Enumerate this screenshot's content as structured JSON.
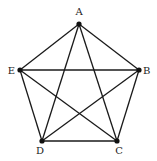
{
  "diagram": {
    "type": "complete-graph",
    "nodes": [
      {
        "id": "A",
        "label": "A",
        "x": 79,
        "y": 24,
        "lx": 79,
        "ly": 15,
        "anchor": "middle"
      },
      {
        "id": "B",
        "label": "B",
        "x": 139,
        "y": 70,
        "lx": 143,
        "ly": 74,
        "anchor": "start"
      },
      {
        "id": "C",
        "label": "C",
        "x": 117,
        "y": 141,
        "lx": 119,
        "ly": 154,
        "anchor": "middle"
      },
      {
        "id": "D",
        "label": "D",
        "x": 42,
        "y": 141,
        "lx": 40,
        "ly": 154,
        "anchor": "middle"
      },
      {
        "id": "E",
        "label": "E",
        "x": 20,
        "y": 70,
        "lx": 15,
        "ly": 74,
        "anchor": "end"
      }
    ],
    "edges": [
      [
        "A",
        "B"
      ],
      [
        "A",
        "C"
      ],
      [
        "A",
        "D"
      ],
      [
        "A",
        "E"
      ],
      [
        "B",
        "C"
      ],
      [
        "B",
        "D"
      ],
      [
        "B",
        "E"
      ],
      [
        "C",
        "D"
      ],
      [
        "C",
        "E"
      ],
      [
        "D",
        "E"
      ]
    ],
    "colors": {
      "edge": "#1a1a1a",
      "node": "#111111",
      "label": "#222222"
    }
  }
}
